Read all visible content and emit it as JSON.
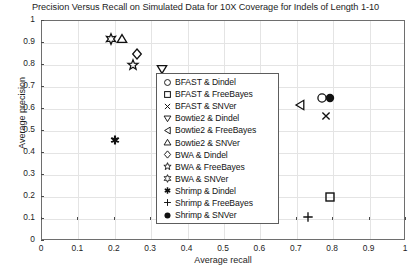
{
  "chart_data": {
    "type": "scatter",
    "title": "Precision Versus Recall on Simulated Data for 10X Coverage for Indels of Length 1-10",
    "xlabel": "Average recall",
    "ylabel": "Average precision",
    "xlim": [
      0,
      1
    ],
    "ylim": [
      0,
      1
    ],
    "grid": true,
    "legend_position": "center",
    "xticks": [
      "0",
      "0.1",
      "0.2",
      "0.3",
      "0.4",
      "0.5",
      "0.6",
      "0.7",
      "0.8",
      "0.9",
      "1"
    ],
    "xtick_values": [
      0,
      0.1,
      0.2,
      0.3,
      0.4,
      0.5,
      0.6,
      0.7,
      0.8,
      0.9,
      1
    ],
    "yticks": [
      "0",
      "0.1",
      "0.2",
      "0.3",
      "0.4",
      "0.5",
      "0.6",
      "0.7",
      "0.8",
      "0.9",
      "1"
    ],
    "ytick_values": [
      0,
      0.1,
      0.2,
      0.3,
      0.4,
      0.5,
      0.6,
      0.7,
      0.8,
      0.9,
      1
    ],
    "series": [
      {
        "name": "BFAST & Dindel",
        "marker": "circle-open",
        "glyph": "○",
        "x": 0.77,
        "y": 0.65
      },
      {
        "name": "BFAST & FreeBayes",
        "marker": "square-open",
        "glyph": "□",
        "x": 0.79,
        "y": 0.2
      },
      {
        "name": "BFAST & SNVer",
        "marker": "cross-x",
        "glyph": "×",
        "x": 0.78,
        "y": 0.57
      },
      {
        "name": "Bowtie2 & Dindel",
        "marker": "triangle-down-open",
        "glyph": "▽",
        "x": 0.33,
        "y": 0.78
      },
      {
        "name": "Bowtie2 & FreeBayes",
        "marker": "triangle-left-open",
        "glyph": "◁",
        "x": 0.71,
        "y": 0.62
      },
      {
        "name": "Bowtie2 & SNVer",
        "marker": "triangle-up-open",
        "glyph": "△",
        "x": 0.22,
        "y": 0.92
      },
      {
        "name": "BWA & Dindel",
        "marker": "diamond-open",
        "glyph": "◇",
        "x": 0.26,
        "y": 0.85
      },
      {
        "name": "BWA & FreeBayes",
        "marker": "pentagram-open",
        "glyph": "☆",
        "x": 0.25,
        "y": 0.8
      },
      {
        "name": "BWA & SNVer",
        "marker": "hexagram-open",
        "glyph": "✶",
        "x": 0.19,
        "y": 0.92
      },
      {
        "name": "Shrimp & Dindel",
        "marker": "asterisk-filled",
        "glyph": "✱",
        "x": 0.2,
        "y": 0.46
      },
      {
        "name": "Shrimp & FreeBayes",
        "marker": "plus",
        "glyph": "+",
        "x": 0.73,
        "y": 0.11
      },
      {
        "name": "Shrimp & SNVer",
        "marker": "circle-filled",
        "glyph": "●",
        "x": 0.79,
        "y": 0.65
      }
    ]
  },
  "colors": {
    "marker": "#111111",
    "axis": "#6e6e6e",
    "grid": "#e4e4e4",
    "text": "#1d1d1d",
    "background": "#ffffff"
  }
}
